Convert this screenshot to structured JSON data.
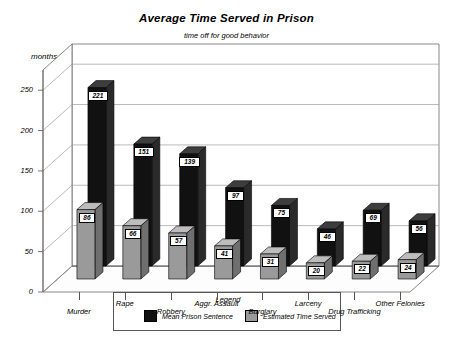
{
  "chart_data": {
    "type": "bar",
    "title": "Average Time Served in Prison",
    "subtitle": "time off for good behavior",
    "xlabel": "",
    "ylabel": "months",
    "ylim": [
      0,
      275
    ],
    "yticks": [
      0,
      50,
      100,
      150,
      200,
      250
    ],
    "grid": true,
    "legend_position": "bottom",
    "legend_title": "Legend",
    "categories": [
      "Murder",
      "Rape",
      "Robbery",
      "Aggr. Assault",
      "Burglary",
      "Larceny",
      "Drug Trafficking",
      "Other Felonies"
    ],
    "series": [
      {
        "name": "Mean Prison Sentence",
        "color": "#111111",
        "values": [
          221,
          151,
          139,
          97,
          75,
          46,
          69,
          56
        ]
      },
      {
        "name": "Estimated Time Served",
        "color": "#9a9a9a",
        "values": [
          86,
          66,
          57,
          41,
          31,
          20,
          22,
          24
        ]
      }
    ]
  },
  "colors": {
    "dark_bar": "#111111",
    "dark_bar_side": "#2a2a2a",
    "dark_bar_top": "#3d3d3d",
    "light_bar": "#9a9a9a",
    "light_bar_side": "#6f6f6f",
    "light_bar_top": "#bdbdbd",
    "grid": "#9b9b9b",
    "axis": "#555555",
    "floor": "#fdfdfd"
  }
}
